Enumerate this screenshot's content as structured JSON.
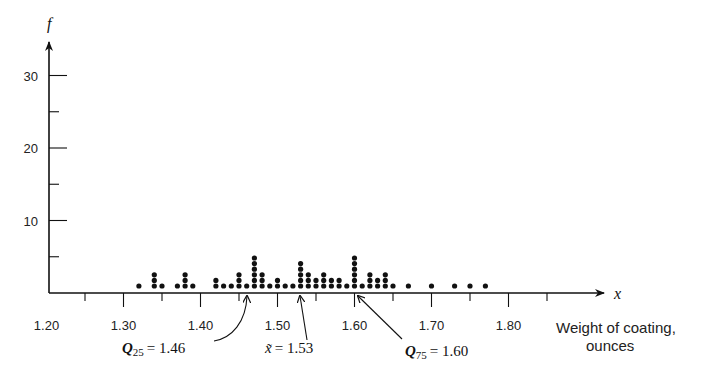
{
  "chart_data": {
    "type": "scatter",
    "subtype": "dot-plot",
    "title": "",
    "xlabel": "Weight of coating, ounces",
    "xlabel_lines": [
      "Weight of coating,",
      "ounces"
    ],
    "ylabel": "f",
    "x_axis_var": "x",
    "xlim": [
      1.2,
      1.85
    ],
    "ylim": [
      0,
      33
    ],
    "x_ticks": [
      1.2,
      1.3,
      1.4,
      1.5,
      1.6,
      1.7,
      1.8
    ],
    "x_tick_labels": [
      "1.20",
      "1.30",
      "1.40",
      "1.50",
      "1.60",
      "1.70",
      "1.80"
    ],
    "x_minor_ticks": [
      1.25,
      1.35,
      1.45,
      1.55,
      1.65,
      1.75,
      1.85
    ],
    "y_ticks": [
      10,
      20,
      30
    ],
    "y_tick_labels": [
      "10",
      "20",
      "30"
    ],
    "y_minor_ticks": [
      5,
      15,
      25
    ],
    "grid": false,
    "legend": null,
    "points": [
      {
        "x": 1.32,
        "count": 1
      },
      {
        "x": 1.34,
        "count": 3
      },
      {
        "x": 1.35,
        "count": 1
      },
      {
        "x": 1.37,
        "count": 1
      },
      {
        "x": 1.38,
        "count": 3
      },
      {
        "x": 1.39,
        "count": 1
      },
      {
        "x": 1.42,
        "count": 2
      },
      {
        "x": 1.43,
        "count": 1
      },
      {
        "x": 1.44,
        "count": 1
      },
      {
        "x": 1.45,
        "count": 3
      },
      {
        "x": 1.46,
        "count": 1
      },
      {
        "x": 1.47,
        "count": 6
      },
      {
        "x": 1.48,
        "count": 3
      },
      {
        "x": 1.49,
        "count": 1
      },
      {
        "x": 1.5,
        "count": 2
      },
      {
        "x": 1.51,
        "count": 1
      },
      {
        "x": 1.52,
        "count": 1
      },
      {
        "x": 1.53,
        "count": 5
      },
      {
        "x": 1.54,
        "count": 3
      },
      {
        "x": 1.55,
        "count": 2
      },
      {
        "x": 1.56,
        "count": 3
      },
      {
        "x": 1.57,
        "count": 2
      },
      {
        "x": 1.58,
        "count": 2
      },
      {
        "x": 1.59,
        "count": 1
      },
      {
        "x": 1.6,
        "count": 6
      },
      {
        "x": 1.61,
        "count": 1
      },
      {
        "x": 1.62,
        "count": 3
      },
      {
        "x": 1.63,
        "count": 2
      },
      {
        "x": 1.64,
        "count": 3
      },
      {
        "x": 1.65,
        "count": 1
      },
      {
        "x": 1.67,
        "count": 1
      },
      {
        "x": 1.7,
        "count": 1
      },
      {
        "x": 1.73,
        "count": 1
      },
      {
        "x": 1.75,
        "count": 1
      },
      {
        "x": 1.77,
        "count": 1
      }
    ],
    "annotations": [
      {
        "name": "q25",
        "symbol": "Q",
        "subscript": "25",
        "text": "= 1.46",
        "x": 1.46
      },
      {
        "name": "median",
        "symbol": "x̃",
        "subscript": "",
        "text": "= 1.53",
        "x": 1.53
      },
      {
        "name": "q75",
        "symbol": "Q",
        "subscript": "75",
        "text": "= 1.60",
        "x": 1.6
      }
    ]
  }
}
